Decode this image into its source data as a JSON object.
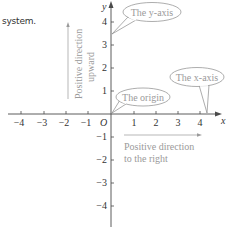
{
  "intro_text": "system.",
  "axes": {
    "x_label": "x",
    "y_label": "y",
    "origin_label": "O",
    "x_ticks": [
      "−4",
      "−3",
      "−2",
      "−1",
      "1",
      "2",
      "3",
      "4"
    ],
    "y_ticks": [
      "4",
      "3",
      "2",
      "1",
      "−1",
      "−2",
      "−3",
      "−4"
    ]
  },
  "callouts": {
    "y_axis": "The y-axis",
    "x_axis": "The x-axis",
    "origin": "The origin"
  },
  "annotations": {
    "up_line1": "Positive direction",
    "up_line2": "upward",
    "right_line1": "Positive direction",
    "right_line2": "to the right"
  },
  "colors": {
    "axis": "#4a4a4a",
    "text": "#333333",
    "annotation": "#9a9a9a",
    "bubble_stroke": "#8a8a8a"
  }
}
